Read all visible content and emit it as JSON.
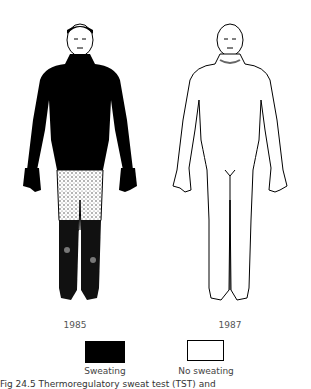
{
  "figures": [
    {
      "year": "1985",
      "state": "sweating"
    },
    {
      "year": "1987",
      "state": "no-sweating"
    }
  ],
  "legend": {
    "sweating": {
      "label": "Sweating",
      "color": "#000000"
    },
    "no_sweating": {
      "label": "No sweating",
      "color": "#ffffff"
    }
  },
  "caption": "Fig 24.5 Thermoregulatory sweat test (TST) and"
}
